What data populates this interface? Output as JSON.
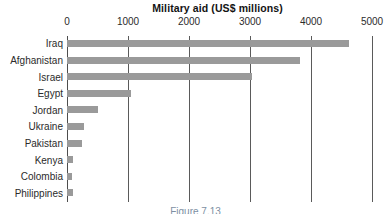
{
  "chart_data": {
    "type": "bar",
    "orientation": "horizontal",
    "title": "Military aid (US$ millions)",
    "xlabel": "",
    "ylabel": "",
    "xlim": [
      0,
      5000
    ],
    "xticks": [
      0,
      1000,
      2000,
      3000,
      4000,
      5000
    ],
    "xtick_labels": [
      "0",
      "1000",
      "2000",
      "3000",
      "4000",
      "5000"
    ],
    "grid": true,
    "grid_axis": "x",
    "legend": false,
    "bar_color": "#9a9a9a",
    "categories": [
      "Iraq",
      "Afghanistan",
      "Israel",
      "Egypt",
      "Jordan",
      "Ukraine",
      "Pakistan",
      "Kenya",
      "Colombia",
      "Philippines"
    ],
    "values": [
      4620,
      3820,
      3030,
      1050,
      510,
      280,
      250,
      100,
      90,
      95
    ]
  },
  "caption": {
    "text": "Figure 7.13"
  }
}
